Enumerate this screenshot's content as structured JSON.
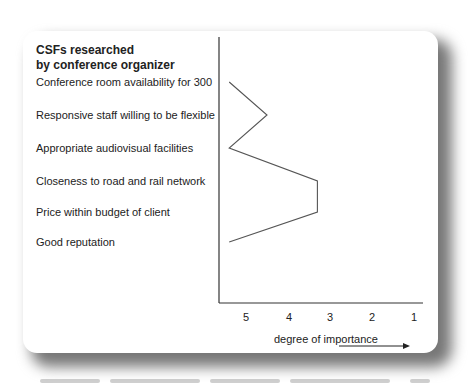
{
  "panel": {
    "title_line1": "CSFs researched",
    "title_line2": "by conference organizer"
  },
  "chart_data": {
    "type": "line",
    "title": "CSFs researched by conference organizer",
    "orientation": "horizontal profile (factors on vertical axis, importance on horizontal axis)",
    "categories": [
      "Conference room availability for 300",
      "Responsive staff willing to be flexible",
      "Appropriate audiovisual facilities",
      "Closeness to road and rail network",
      "Price within budget of client",
      "Good reputation"
    ],
    "values": [
      5.4,
      4.5,
      5.4,
      3.3,
      3.3,
      5.4
    ],
    "xlabel": "degree of importance",
    "x_ticks": [
      "5",
      "4",
      "3",
      "2",
      "1"
    ],
    "xlim": [
      5.5,
      1
    ],
    "x_axis_direction": "reversed (5 near axis, 1 at far right)",
    "grid": false,
    "legend": "none"
  },
  "colors": {
    "line": "#555555",
    "axis": "#333333",
    "shadow": "#777777"
  }
}
